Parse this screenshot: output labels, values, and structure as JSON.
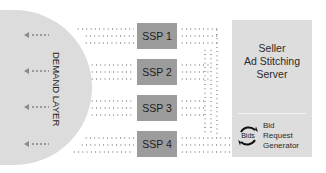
{
  "demand_layer": {
    "label": "DEMAND LAYER"
  },
  "ssps": [
    {
      "label": "SSP 1"
    },
    {
      "label": "SSP 2"
    },
    {
      "label": "SSP 3"
    },
    {
      "label": "SSP 4"
    }
  ],
  "seller_server": {
    "title_lines": [
      "Seller",
      "Ad Stitching",
      "Server"
    ],
    "component": {
      "icon_label": "Bids",
      "lines": [
        "Bid",
        "Request",
        "Generator"
      ]
    }
  },
  "colors": {
    "demand_fill": "#dcdcdc",
    "ssp_fill": "#9c9c9c",
    "seller_fill": "#dddddd",
    "dots": "#a5a5a5"
  }
}
